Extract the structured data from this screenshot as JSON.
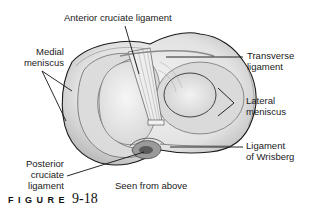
{
  "figure": {
    "caption_word": "FIGURE",
    "caption_number": "9-18",
    "view_note": "Seen from above"
  },
  "labels": {
    "anterior_cruciate": "Anterior cruciate ligament",
    "medial_meniscus_1": "Medial",
    "medial_meniscus_2": "meniscus",
    "transverse_1": "Transverse",
    "transverse_2": "ligament",
    "lateral_meniscus_1": "Lateral",
    "lateral_meniscus_2": "meniscus",
    "wrisberg_1": "Ligament",
    "wrisberg_2": "of Wrisberg",
    "posterior_cruciate_1": "Posterior",
    "posterior_cruciate_2": "cruciate",
    "posterior_cruciate_3": "ligament"
  },
  "colors": {
    "ink": "#1a1a1a",
    "bone_fill": "#e9e9e9",
    "bone_shade": "#c8c8c8",
    "background": "#ffffff"
  }
}
